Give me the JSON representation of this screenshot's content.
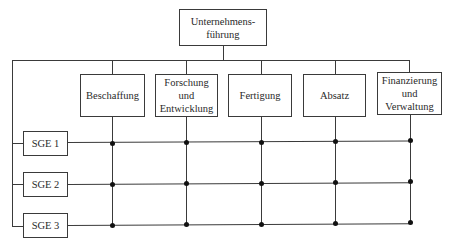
{
  "diagram": {
    "type": "matrix-organization",
    "top": {
      "label": "Unternehmens-\nführung"
    },
    "functions": [
      {
        "label": "Beschaffung"
      },
      {
        "label": "Forschung\nund\nEntwicklung"
      },
      {
        "label": "Fertigung"
      },
      {
        "label": "Absatz"
      },
      {
        "label": "Finanzierung\nund\nVerwaltung"
      }
    ],
    "business_units": [
      {
        "label": "SGE 1"
      },
      {
        "label": "SGE 2"
      },
      {
        "label": "SGE 3"
      }
    ],
    "colors": {
      "line": "#3a3a3a",
      "node": "#111111",
      "background": "#ffffff"
    }
  }
}
